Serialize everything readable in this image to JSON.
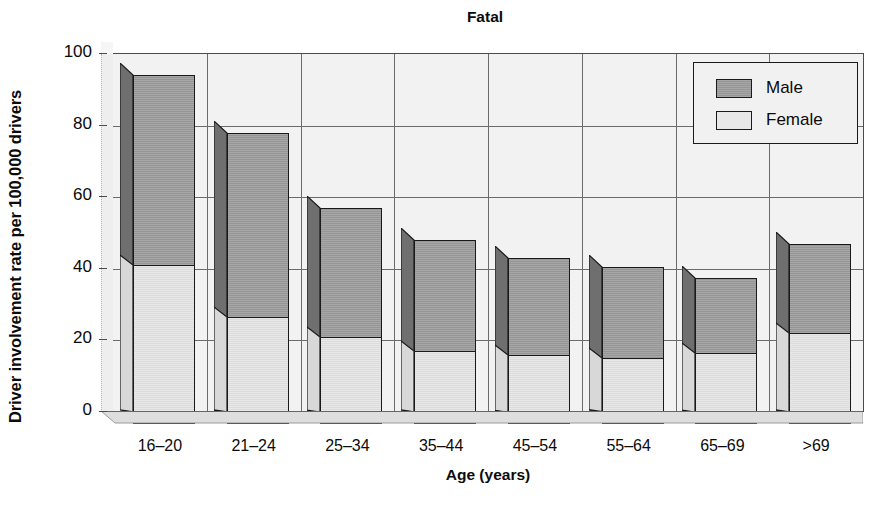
{
  "chart_data": {
    "type": "bar",
    "title": "Fatal",
    "xlabel": "Age (years)",
    "ylabel": "Driver involvement rate per 100,000 drivers",
    "categories": [
      "16–20",
      "21–24",
      "25–34",
      "35–44",
      "45–54",
      "55–64",
      "65–69",
      ">69"
    ],
    "series": [
      {
        "name": "Male",
        "values": [
          94,
          78,
          57,
          48,
          43,
          40.5,
          37.5,
          47
        ]
      },
      {
        "name": "Female",
        "values": [
          41,
          26.5,
          21,
          17,
          16,
          15,
          16.5,
          22
        ]
      }
    ],
    "ylim": [
      0,
      100
    ],
    "ytick_labels": [
      "0",
      "20",
      "40",
      "60",
      "80",
      "100"
    ],
    "ytick_values": [
      0,
      20,
      40,
      60,
      80,
      100
    ],
    "grid": true,
    "legend_position": "top-right",
    "style": "3d-overlapping-bars",
    "colors": {
      "male": "#9d9d9d",
      "female": "#e3e3e3",
      "bar_outline": "#1a1a1a",
      "plot_background": "#f2f2f2",
      "gridline": "#6b6b6b",
      "text": "#0b0b0b"
    }
  },
  "legend": {
    "items": [
      {
        "label": "Male",
        "swatch": "male"
      },
      {
        "label": "Female",
        "swatch": "female"
      }
    ]
  }
}
